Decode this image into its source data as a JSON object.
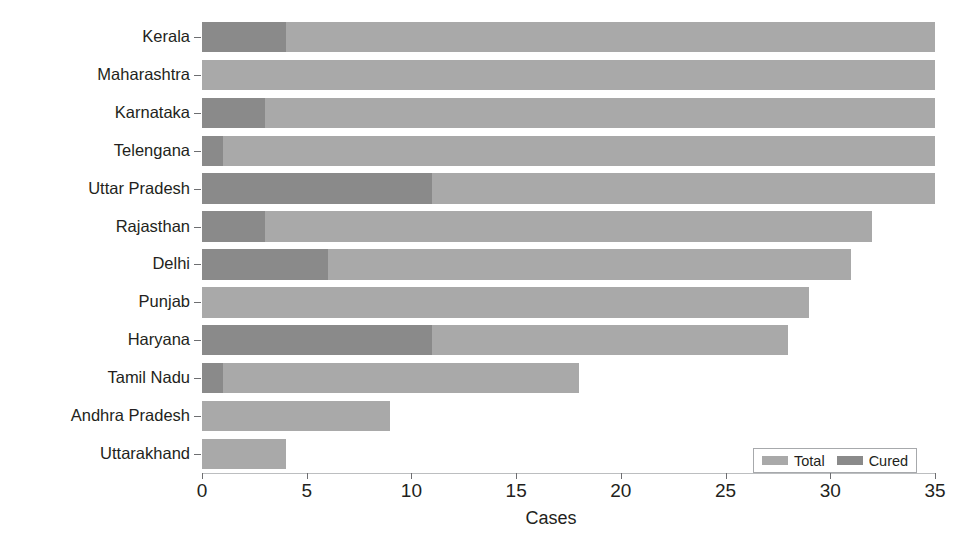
{
  "chart_data": {
    "type": "bar",
    "orientation": "horizontal",
    "stacked": false,
    "title": "",
    "xlabel": "Cases",
    "ylabel": "",
    "xlim": [
      0,
      35
    ],
    "xticks": [
      0,
      5,
      10,
      15,
      20,
      25,
      30,
      35
    ],
    "xticklabels": [
      "0",
      "5",
      "10",
      "15",
      "20",
      "25",
      "30",
      "35"
    ],
    "grid": false,
    "legend": {
      "position": "lower right",
      "entries": [
        {
          "name": "Total",
          "color": "#a9a9a9"
        },
        {
          "name": "Cured",
          "color": "#8a8a8a"
        }
      ]
    },
    "categories": [
      "Kerala",
      "Maharashtra",
      "Karnataka",
      "Telengana",
      "Uttar Pradesh",
      "Rajasthan",
      "Delhi",
      "Punjab",
      "Haryana",
      "Tamil Nadu",
      "Andhra Pradesh",
      "Uttarakhand"
    ],
    "series": [
      {
        "name": "Total",
        "color": "#a9a9a9",
        "values": [
          35,
          35,
          35,
          35,
          35,
          32,
          31,
          29,
          28,
          18,
          9,
          4
        ]
      },
      {
        "name": "Cured",
        "color": "#8a8a8a",
        "values": [
          4,
          0,
          3,
          1,
          11,
          3,
          6,
          0,
          11,
          1,
          0,
          0
        ]
      }
    ]
  },
  "axis": {
    "x_title": "Cases"
  },
  "colors": {
    "total": "#a9a9a9",
    "cured": "#8a8a8a",
    "text": "#231f20",
    "axis": "#6d6e71",
    "background": "#ffffff"
  }
}
